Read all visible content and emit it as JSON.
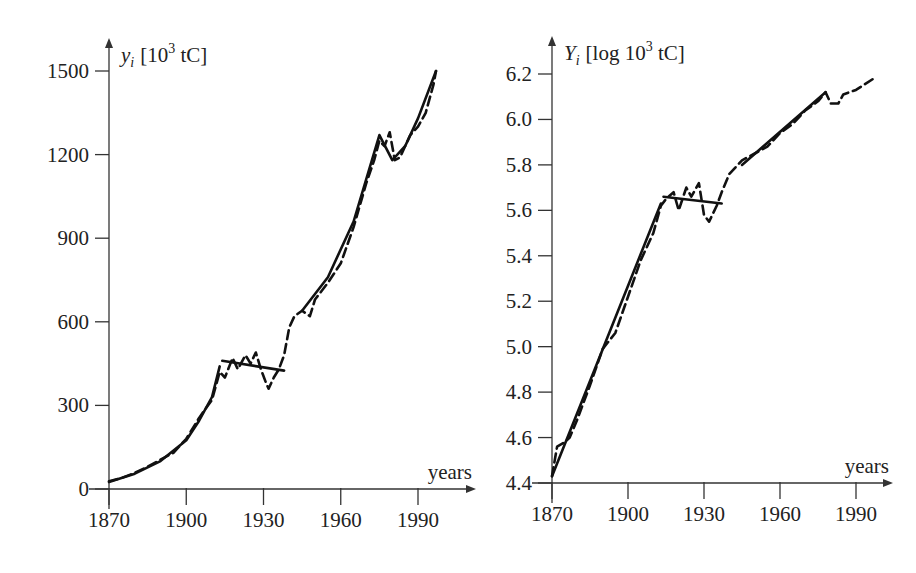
{
  "chart_data": [
    {
      "type": "line",
      "title": "",
      "ylabel": "y_i [10^3 tC]",
      "ylabel_parts": {
        "var": "y",
        "sub": "i",
        "unit_pre": "[10",
        "sup": "3",
        "unit_post": " tC]"
      },
      "xlabel": "years",
      "xticks": [
        1870,
        1900,
        1930,
        1960,
        1990
      ],
      "yticks": [
        0,
        300,
        600,
        900,
        1200,
        1500
      ],
      "ytick_labels": [
        "0",
        "300",
        "600",
        "900",
        "1200",
        "1500"
      ],
      "xlim": [
        1870,
        2007
      ],
      "ylim": [
        0,
        1600
      ],
      "grid": false,
      "legend": "none",
      "series": [
        {
          "name": "observed (dashed)",
          "style": "dashed",
          "x": [
            1870,
            1875,
            1880,
            1885,
            1890,
            1895,
            1900,
            1905,
            1910,
            1913,
            1915,
            1918,
            1920,
            1923,
            1925,
            1927,
            1929,
            1931,
            1932,
            1934,
            1936,
            1938,
            1940,
            1942,
            1945,
            1948,
            1950,
            1955,
            1960,
            1965,
            1970,
            1973,
            1975,
            1977,
            1979,
            1981,
            1983,
            1985,
            1987,
            1990,
            1993,
            1996,
            1997
          ],
          "y": [
            28,
            40,
            58,
            80,
            105,
            130,
            180,
            255,
            320,
            420,
            400,
            470,
            430,
            480,
            450,
            490,
            430,
            380,
            360,
            400,
            430,
            480,
            580,
            620,
            640,
            620,
            680,
            740,
            810,
            940,
            1100,
            1180,
            1250,
            1230,
            1280,
            1180,
            1190,
            1230,
            1270,
            1300,
            1350,
            1450,
            1500
          ]
        },
        {
          "name": "fit segment 1870-1913",
          "style": "solid",
          "x": [
            1870,
            1880,
            1890,
            1900,
            1905,
            1910,
            1913
          ],
          "y": [
            25,
            55,
            100,
            175,
            245,
            330,
            440
          ]
        },
        {
          "name": "fit segment 1914-1938",
          "style": "solid",
          "x": [
            1914,
            1938
          ],
          "y": [
            460,
            425
          ]
        },
        {
          "name": "fit segment 1945-1997",
          "style": "solid",
          "x": [
            1945,
            1955,
            1965,
            1975,
            1980,
            1985,
            1990,
            1997
          ],
          "y": [
            640,
            760,
            960,
            1270,
            1180,
            1230,
            1330,
            1500
          ]
        }
      ]
    },
    {
      "type": "line",
      "title": "",
      "ylabel": "Y_i [log 10^3 tC]",
      "ylabel_parts": {
        "var": "Y",
        "sub": "i",
        "unit_pre": "[log 10",
        "sup": "3",
        "unit_post": " tC]"
      },
      "xlabel": "years",
      "xticks": [
        1870,
        1900,
        1930,
        1960,
        1990
      ],
      "yticks": [
        4.4,
        4.6,
        4.8,
        5.0,
        5.2,
        5.4,
        5.6,
        5.8,
        6.0,
        6.2
      ],
      "ytick_labels": [
        "4.4",
        "4.6",
        "4.8",
        "5.0",
        "5.2",
        "5.4",
        "5.6",
        "5.8",
        "6.0",
        "6.2"
      ],
      "xlim": [
        1870,
        2002
      ],
      "ylim": [
        4.4,
        6.3
      ],
      "grid": false,
      "legend": "none",
      "series": [
        {
          "name": "observed (dashed)",
          "style": "dashed",
          "x": [
            1870,
            1872,
            1875,
            1877,
            1880,
            1885,
            1890,
            1895,
            1900,
            1905,
            1910,
            1913,
            1915,
            1918,
            1920,
            1923,
            1925,
            1928,
            1930,
            1932,
            1935,
            1937,
            1940,
            1945,
            1950,
            1955,
            1960,
            1965,
            1970,
            1975,
            1978,
            1980,
            1983,
            1985,
            1990,
            1997
          ],
          "y": [
            4.43,
            4.56,
            4.58,
            4.6,
            4.68,
            4.83,
            4.99,
            5.06,
            5.22,
            5.38,
            5.5,
            5.62,
            5.65,
            5.68,
            5.6,
            5.7,
            5.66,
            5.72,
            5.58,
            5.55,
            5.62,
            5.68,
            5.76,
            5.82,
            5.85,
            5.88,
            5.94,
            5.98,
            6.04,
            6.08,
            6.12,
            6.07,
            6.07,
            6.11,
            6.13,
            6.18
          ]
        },
        {
          "name": "fit segment 1870-1913",
          "style": "solid",
          "x": [
            1870,
            1913
          ],
          "y": [
            4.43,
            5.63
          ]
        },
        {
          "name": "fit segment 1914-1938",
          "style": "solid",
          "x": [
            1914,
            1937
          ],
          "y": [
            5.66,
            5.63
          ]
        },
        {
          "name": "fit segment 1945-1978",
          "style": "solid",
          "x": [
            1945,
            1978
          ],
          "y": [
            5.8,
            6.12
          ]
        }
      ]
    }
  ],
  "layout": {
    "panels": [
      {
        "x0": 109,
        "x1": 418,
        "yr0": 1870,
        "yr1": 1990,
        "y_base": 489,
        "y_top_px": 71,
        "v0": 0,
        "v1": 1500,
        "axis_right": 476,
        "axis_top": 38
      },
      {
        "x0": 552,
        "x1": 856,
        "yr0": 1870,
        "yr1": 1990,
        "y_base": 483,
        "y_top_px": 74,
        "v0": 4.4,
        "v1": 6.2,
        "axis_right": 893,
        "axis_top": 36
      }
    ]
  }
}
